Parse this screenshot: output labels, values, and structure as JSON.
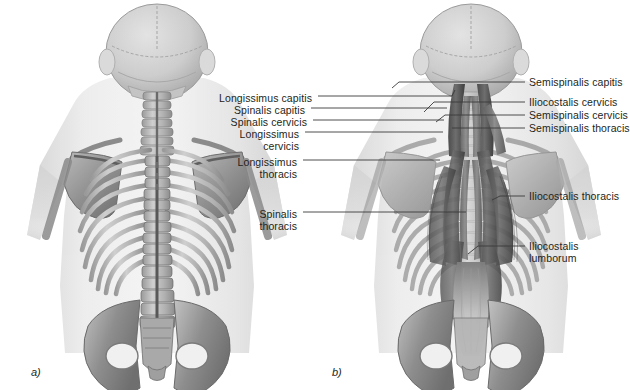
{
  "figure": {
    "type": "anatomical-illustration",
    "style": "grayscale medical illustration",
    "background_color": "#ffffff",
    "text_color": "#231f20",
    "leader_line_color": "#3a3a3a",
    "panels": [
      {
        "id": "a",
        "caption": "a)",
        "content": "Posterior view of axial skeleton without musculature"
      },
      {
        "id": "b",
        "caption": "b)",
        "content": "Posterior view with erector spinae and transversospinalis musculature"
      }
    ]
  },
  "labels_left": [
    {
      "text": "Longissimus capitis",
      "lines": [
        "Longissimus capitis"
      ]
    },
    {
      "text": "Spinalis capitis",
      "lines": [
        "Spinalis capitis"
      ]
    },
    {
      "text": "Spinalis cervicis",
      "lines": [
        "Spinalis cervicis"
      ]
    },
    {
      "text": "Longissimus cervicis",
      "lines": [
        "Longissimus",
        "cervicis"
      ]
    },
    {
      "text": "Longissimus thoracis",
      "lines": [
        "Longissimus",
        "thoracis"
      ]
    },
    {
      "text": "Spinalis thoracis",
      "lines": [
        "Spinalis",
        "thoracis"
      ]
    }
  ],
  "labels_right": [
    {
      "text": "Semispinalis capitis",
      "lines": [
        "Semispinalis capitis"
      ]
    },
    {
      "text": "Iliocostalis cervicis",
      "lines": [
        "Iliocostalis cervicis"
      ]
    },
    {
      "text": "Semispinalis cervicis",
      "lines": [
        "Semispinalis cervicis"
      ]
    },
    {
      "text": "Semispinalis thoracis",
      "lines": [
        "Semispinalis thoracis"
      ]
    },
    {
      "text": "Iliocostalis thoracis",
      "lines": [
        "Iliocostalis thoracis"
      ]
    },
    {
      "text": "Iliocostalis lumborum",
      "lines": [
        "Iliocostalis",
        "lumborum"
      ]
    }
  ],
  "captions": {
    "panel_a": "a)",
    "panel_b": "b)"
  }
}
